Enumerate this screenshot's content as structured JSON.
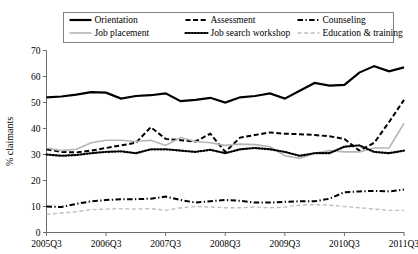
{
  "chart_data": {
    "type": "line",
    "title": "",
    "xlabel": "",
    "ylabel": "% claimants",
    "ylim": [
      0,
      70
    ],
    "ytick_step": 10,
    "yticks": [
      0,
      10,
      20,
      30,
      40,
      50,
      60,
      70
    ],
    "grid": false,
    "legend_position": "top",
    "x": [
      "2005Q3",
      "2005Q4",
      "2006Q1",
      "2006Q2",
      "2006Q3",
      "2006Q4",
      "2007Q1",
      "2007Q2",
      "2007Q3",
      "2007Q4",
      "2008Q1",
      "2008Q2",
      "2008Q3",
      "2008Q4",
      "2009Q1",
      "2009Q2",
      "2009Q3",
      "2009Q4",
      "2010Q1",
      "2010Q2",
      "2010Q3",
      "2010Q4",
      "2011Q1",
      "2011Q2",
      "2011Q3"
    ],
    "xtick_labels": [
      "2005Q3",
      "2006Q3",
      "2007Q3",
      "2008Q3",
      "2009Q3",
      "2010Q3",
      "2011Q3"
    ],
    "xtick_indices": [
      0,
      4,
      8,
      12,
      16,
      20,
      24
    ],
    "series": [
      {
        "name": "Orientation",
        "style": "solid",
        "color": "#000000",
        "width": 2.2,
        "values": [
          52.0,
          52.3,
          53.0,
          54.0,
          53.8,
          51.5,
          52.5,
          52.8,
          53.5,
          50.5,
          51.0,
          51.8,
          50.0,
          52.0,
          52.5,
          53.5,
          51.5,
          54.5,
          57.5,
          56.5,
          56.8,
          61.5,
          64.0,
          62.0,
          63.5
        ]
      },
      {
        "name": "Assessment",
        "style": "dashed",
        "color": "#000000",
        "width": 2.0,
        "values": [
          32.0,
          31.0,
          30.8,
          31.5,
          32.5,
          33.5,
          34.5,
          40.5,
          36.0,
          35.5,
          35.0,
          38.0,
          31.0,
          36.5,
          37.5,
          38.5,
          38.0,
          37.8,
          37.5,
          37.0,
          36.0,
          31.5,
          34.5,
          42.5,
          51.0
        ]
      },
      {
        "name": "Counseling",
        "style": "dashdot",
        "color": "#000000",
        "width": 2.0,
        "values": [
          10.0,
          9.8,
          11.0,
          12.0,
          12.5,
          12.8,
          12.8,
          13.0,
          13.8,
          12.5,
          11.5,
          12.0,
          12.5,
          12.2,
          11.5,
          11.5,
          11.8,
          12.0,
          12.0,
          13.0,
          15.5,
          15.8,
          16.0,
          15.8,
          16.5
        ]
      },
      {
        "name": "Job placement",
        "style": "solid",
        "color": "#b5b5b5",
        "width": 1.6,
        "values": [
          32.5,
          31.5,
          32.0,
          34.5,
          35.5,
          35.5,
          35.0,
          35.5,
          33.5,
          36.5,
          35.0,
          34.5,
          33.5,
          34.0,
          33.8,
          33.0,
          29.5,
          28.5,
          30.5,
          31.5,
          31.0,
          31.0,
          32.5,
          32.5,
          42.0
        ]
      },
      {
        "name": "Job search workshop",
        "style": "dotted",
        "color": "#000000",
        "width": 2.2,
        "values": [
          30.0,
          29.5,
          29.8,
          30.5,
          31.0,
          31.2,
          30.5,
          32.0,
          32.0,
          31.5,
          31.0,
          31.8,
          30.5,
          32.0,
          32.5,
          32.0,
          31.0,
          29.5,
          30.5,
          30.5,
          33.0,
          33.5,
          31.0,
          30.5,
          31.5
        ]
      },
      {
        "name": "Education & training",
        "style": "dashed-light",
        "color": "#bfbfbf",
        "width": 1.4,
        "values": [
          7.0,
          7.5,
          8.0,
          8.8,
          9.0,
          9.2,
          9.0,
          9.2,
          8.5,
          9.5,
          10.0,
          9.8,
          9.5,
          9.5,
          9.8,
          9.5,
          9.8,
          10.5,
          10.8,
          10.5,
          10.0,
          9.5,
          9.0,
          8.5,
          8.5
        ]
      }
    ]
  },
  "legend": {
    "entries": [
      {
        "label": "Orientation"
      },
      {
        "label": "Assessment"
      },
      {
        "label": "Counseling"
      },
      {
        "label": "Job placement"
      },
      {
        "label": "Job search workshop"
      },
      {
        "label": "Education & training"
      }
    ]
  },
  "axes": {
    "y_title": "% claimants"
  }
}
